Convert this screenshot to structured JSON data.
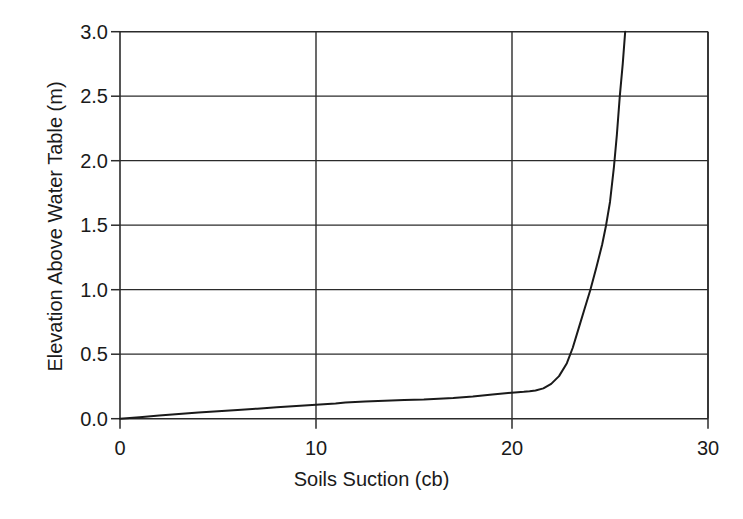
{
  "chart_data": {
    "type": "line",
    "title": "",
    "xlabel": "Soils Suction (cb)",
    "ylabel": "Elevation Above Water Table (m)",
    "xlim": [
      0,
      30
    ],
    "ylim": [
      0,
      3.0
    ],
    "xticks": [
      "0",
      "10",
      "20",
      "30"
    ],
    "xtick_values": [
      0,
      10,
      20,
      30
    ],
    "yticks": [
      "0.0",
      "0.5",
      "1.0",
      "1.5",
      "2.0",
      "2.5",
      "3.0"
    ],
    "ytick_values": [
      0.0,
      0.5,
      1.0,
      1.5,
      2.0,
      2.5,
      3.0
    ],
    "grid": "horizontal-and-vertical",
    "legend": "none",
    "line_color": "#1a1a1a",
    "line_width": 2,
    "series": [
      {
        "name": "Soil suction profile",
        "x": [
          0.0,
          1.0,
          2.0,
          3.0,
          4.0,
          5.0,
          6.0,
          7.0,
          8.0,
          9.0,
          10.0,
          11.0,
          11.5,
          12.5,
          13.5,
          14.5,
          15.5,
          16.0,
          17.0,
          18.0,
          19.0,
          19.8,
          20.3,
          20.6,
          20.9,
          21.2,
          21.6,
          22.0,
          22.4,
          22.8,
          23.1,
          23.4,
          23.7,
          24.0,
          24.3,
          24.6,
          24.8,
          25.0,
          25.2,
          25.35,
          25.5,
          25.65,
          25.8
        ],
        "y": [
          0.0,
          0.012,
          0.024,
          0.036,
          0.048,
          0.058,
          0.068,
          0.078,
          0.088,
          0.098,
          0.108,
          0.118,
          0.125,
          0.133,
          0.139,
          0.144,
          0.148,
          0.152,
          0.16,
          0.172,
          0.188,
          0.2,
          0.205,
          0.208,
          0.212,
          0.218,
          0.235,
          0.27,
          0.33,
          0.43,
          0.55,
          0.7,
          0.85,
          1.0,
          1.17,
          1.35,
          1.5,
          1.68,
          1.95,
          2.2,
          2.5,
          2.75,
          3.05
        ]
      }
    ]
  },
  "axes": {
    "x_title": "Soils Suction (cb)",
    "y_title": "Elevation Above Water Table (m)"
  }
}
